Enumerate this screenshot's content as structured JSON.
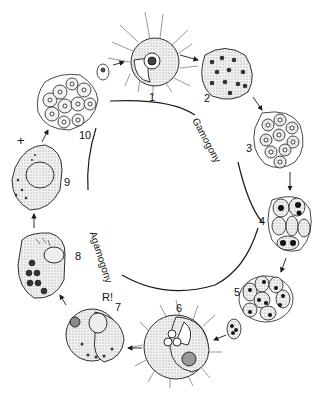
{
  "diagram": {
    "stages": [
      {
        "id": "1",
        "label": "1",
        "x": 149,
        "y": 92
      },
      {
        "id": "2",
        "label": "2",
        "x": 204,
        "y": 93
      },
      {
        "id": "3",
        "label": "3",
        "x": 246,
        "y": 143
      },
      {
        "id": "4",
        "label": "4",
        "x": 259,
        "y": 216
      },
      {
        "id": "5",
        "label": "5",
        "x": 234,
        "y": 287
      },
      {
        "id": "6",
        "label": "6",
        "x": 176,
        "y": 303
      },
      {
        "id": "7",
        "label": "7",
        "x": 115,
        "y": 302
      },
      {
        "id": "8",
        "label": "8",
        "x": 75,
        "y": 251
      },
      {
        "id": "9",
        "label": "9",
        "x": 64,
        "y": 177
      },
      {
        "id": "10",
        "label": "10",
        "x": 79,
        "y": 130
      }
    ],
    "annotations": [
      {
        "id": "reduction",
        "label": "R!",
        "x": 102,
        "y": 292
      },
      {
        "id": "plus",
        "label": "+",
        "x": 17,
        "y": 134
      }
    ],
    "phases": {
      "gamogony": "Gamogony",
      "agamogony": "Agamogony"
    },
    "colors": {
      "background": "#ffffff",
      "ink": "#1a1a1a",
      "stipple": "#d4d4d4",
      "nucleus": "#222222"
    }
  }
}
